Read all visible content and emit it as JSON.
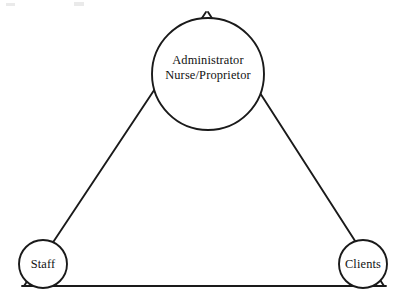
{
  "diagram": {
    "type": "triangle-relationship-diagram",
    "background_color": "#ffffff",
    "stroke_color": "#1a1a1a",
    "text_color": "#111111",
    "nodes": [
      {
        "id": "apex",
        "position": "top",
        "shape": "circle",
        "label_lines": [
          "Administrator",
          "Nurse/Proprietor"
        ],
        "line1": "Administrator",
        "line2": "Nurse/Proprietor",
        "center_x": 208,
        "center_y": 74,
        "radius": 56
      },
      {
        "id": "bottom-left",
        "position": "bottom-left",
        "shape": "circle",
        "label": "Staff",
        "center_x": 43,
        "center_y": 264,
        "radius": 24
      },
      {
        "id": "bottom-right",
        "position": "bottom-right",
        "shape": "circle",
        "label": "Clients",
        "center_x": 363,
        "center_y": 264,
        "radius": 24
      }
    ],
    "edges": [
      {
        "id": "left-edge",
        "from": "apex",
        "to": "bottom-left"
      },
      {
        "id": "right-edge",
        "from": "apex",
        "to": "bottom-right"
      },
      {
        "id": "base-edge",
        "from": "bottom-left",
        "to": "bottom-right"
      }
    ]
  }
}
